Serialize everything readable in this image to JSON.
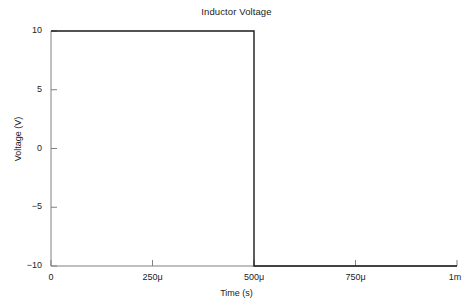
{
  "chart_data": {
    "type": "line",
    "title": "Inductor Voltage",
    "xlabel": "Time (s)",
    "ylabel": "Voltage (V)",
    "xlim": [
      0,
      0.001
    ],
    "ylim": [
      -10,
      10
    ],
    "grid": false,
    "legend": null,
    "x_tick_labels": [
      "0",
      "250μ",
      "500μ",
      "750μ",
      "1m"
    ],
    "x_tick_values": [
      0,
      0.00025,
      0.0005,
      0.00075,
      0.001
    ],
    "y_tick_labels": [
      "10",
      "5",
      "0",
      "−5",
      "−10"
    ],
    "y_tick_values": [
      10,
      5,
      0,
      -5,
      -10
    ],
    "series": [
      {
        "name": "Inductor Voltage",
        "color": "#1a1a1a",
        "x": [
          0,
          0.0005,
          0.0005,
          0.001
        ],
        "values": [
          10,
          10,
          -10,
          -10
        ]
      }
    ],
    "annotations": []
  },
  "axes": {
    "axis_color": "#808080",
    "tick_color": "#808080",
    "text_color": "#232323",
    "background": "#ffffff"
  }
}
